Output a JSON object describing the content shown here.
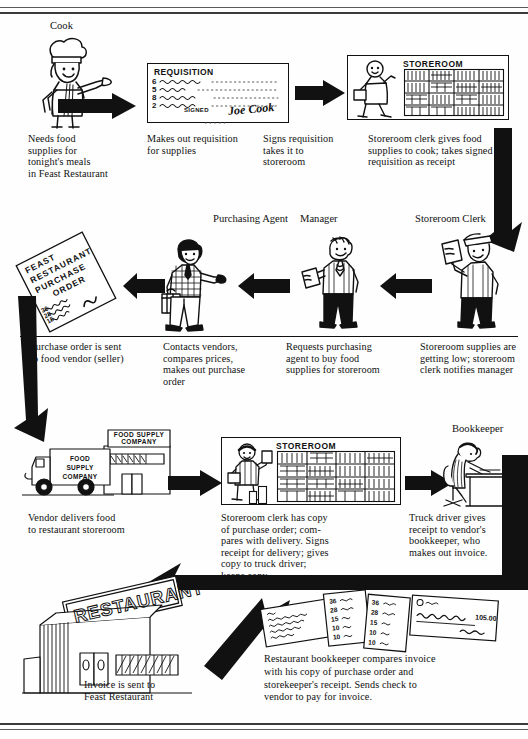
{
  "page": {
    "top_rule": "",
    "bottom_rule": ""
  },
  "colors": {
    "ink": "#111111",
    "paper": "#fefefe",
    "rule": "#5a5a5a"
  },
  "roles": {
    "cook": "Cook",
    "purchasing_agent": "Purchasing Agent",
    "manager": "Manager",
    "storeroom_clerk": "Storeroom Clerk",
    "bookkeeper": "Bookkeeper"
  },
  "labels": {
    "requisition_title": "REQUISITION",
    "requisition_signed": "SIGNED",
    "requisition_signature": "Joe Cook",
    "requisition_quantities": [
      "6",
      "5",
      "8",
      "2"
    ],
    "storeroom_top": "STOREROOM",
    "storeroom_bottom": "STOREROOM",
    "purchase_order": "FEAST RESTAURANT PURCHASE ORDER",
    "purchase_order_lines": [
      "36",
      "28",
      "15",
      "10",
      "10"
    ],
    "purchase_order_signature": "John Doe",
    "truck": "FOOD SUPPLY COMPANY",
    "warehouse_sign": "FOOD SUPPLY COMPANY",
    "restaurant_sign": "RESTAURANT",
    "check_amount": "105.00",
    "invoice_lines": [
      "36",
      "28",
      "15",
      "10",
      "10"
    ],
    "receipt_lines": [
      "36",
      "28",
      "15",
      "10",
      "10"
    ]
  },
  "captions": {
    "cook": "Needs food\nsupplies for\ntonight's meals\nin Feast Restaurant",
    "requisition": "Makes out requisition\nfor supplies",
    "signs": "Signs requisition\ntakes it to\nstoreroom",
    "clerk_gives": "Storeroom clerk gives food\nsupplies to cook; takes signed\nrequisition as receipt",
    "purchase_order_sent": "Purchase order is sent\nto food vendor (seller)",
    "contacts_vendors": "Contacts vendors,\ncompares prices,\nmakes out purchase\norder",
    "requests_purchasing": "Requests purchasing\nagent to buy food\nsupplies for storeroom",
    "supplies_low": "Storeroom supplies are\ngetting low; storeroom\nclerk notifies manager",
    "vendor_delivers": "Vendor delivers food\nto restaurant storeroom",
    "clerk_has_copy": "Storeroom clerk has copy\nof purchase order; com-\npares with delivery.  Signs\nreceipt for delivery; gives\ncopy to truck driver;\nkeeps copy.",
    "truck_driver": "Truck driver gives\nreceipt to vendor's\nbookkeeper, who\nmakes out invoice.",
    "invoice_sent": "Invoice is sent to\nFeast Restaurant",
    "restaurant_bookkeeper": "Restaurant bookkeeper compares invoice\nwith his copy of purchase order and\nstorekeeper's receipt.  Sends check to\nvendor to pay for invoice."
  }
}
